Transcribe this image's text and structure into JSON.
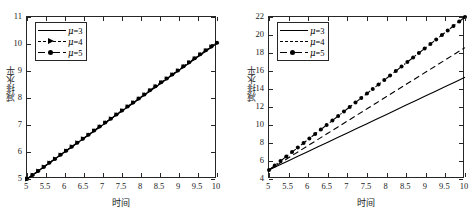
{
  "figure": {
    "panels": [
      {
        "id": "left",
        "axis_title_x": "时间",
        "axis_title_y": "减排水平",
        "xticks": [
          "5",
          "5.5",
          "6",
          "6.5",
          "7",
          "7.5",
          "8",
          "8.5",
          "9",
          "9.5",
          "10"
        ],
        "yticks": [
          "5",
          "6",
          "7",
          "8",
          "9",
          "10",
          "11"
        ],
        "legend": [
          {
            "label_prefix": "μ",
            "label_suffix": "=3",
            "style": "solid",
            "marker": "none"
          },
          {
            "label_prefix": "μ",
            "label_suffix": "=4",
            "style": "dashed",
            "marker": "triangle"
          },
          {
            "label_prefix": "μ",
            "label_suffix": "=5",
            "style": "dashdot",
            "marker": "circle"
          }
        ]
      },
      {
        "id": "right",
        "axis_title_x": "时间",
        "axis_title_y": "减排水平",
        "xticks": [
          "5",
          "5.5",
          "6",
          "6.5",
          "7",
          "7.5",
          "8",
          "8.5",
          "9",
          "9.5",
          "10"
        ],
        "yticks": [
          "4",
          "6",
          "8",
          "10",
          "12",
          "14",
          "16",
          "18",
          "20",
          "22"
        ],
        "legend": [
          {
            "label_prefix": "μ",
            "label_suffix": "=3",
            "style": "solid",
            "marker": "none"
          },
          {
            "label_prefix": "μ",
            "label_suffix": "=4",
            "style": "dashed",
            "marker": "none"
          },
          {
            "label_prefix": "μ",
            "label_suffix": "=5",
            "style": "dashdot",
            "marker": "circle"
          }
        ]
      }
    ]
  },
  "chart_data": [
    {
      "type": "line",
      "panel": "left",
      "title": "",
      "xlabel": "时间",
      "ylabel": "减排水平",
      "xlim": [
        5,
        10
      ],
      "ylim": [
        5,
        11
      ],
      "xticks": [
        5,
        5.5,
        6,
        6.5,
        7,
        7.5,
        8,
        8.5,
        9,
        9.5,
        10
      ],
      "yticks": [
        5,
        6,
        7,
        8,
        9,
        10,
        11
      ],
      "grid": false,
      "legend_position": "upper-left",
      "x": [
        5,
        5.25,
        5.5,
        5.75,
        6,
        6.25,
        6.5,
        6.75,
        7,
        7.25,
        7.5,
        7.75,
        8,
        8.25,
        8.5,
        8.75,
        9,
        9.25,
        9.5,
        9.75,
        10
      ],
      "series": [
        {
          "name": "μ=3",
          "style": "solid",
          "marker": "none",
          "values": [
            5.0,
            5.25,
            5.5,
            5.76,
            6.01,
            6.26,
            6.51,
            6.76,
            7.01,
            7.27,
            7.52,
            7.77,
            8.02,
            8.27,
            8.52,
            8.78,
            9.03,
            9.28,
            9.53,
            9.78,
            10.03
          ]
        },
        {
          "name": "μ=4",
          "style": "dashed",
          "marker": "triangle",
          "values": [
            5.0,
            5.25,
            5.51,
            5.76,
            6.01,
            6.27,
            6.52,
            6.77,
            7.02,
            7.28,
            7.53,
            7.78,
            8.03,
            8.29,
            8.54,
            8.79,
            9.04,
            9.29,
            9.55,
            9.8,
            10.04
          ]
        },
        {
          "name": "μ=5",
          "style": "dashdot",
          "marker": "circle",
          "values": [
            5.0,
            5.25,
            5.51,
            5.76,
            6.02,
            6.27,
            6.52,
            6.78,
            7.03,
            7.28,
            7.54,
            7.79,
            8.04,
            8.3,
            8.55,
            8.8,
            9.05,
            9.31,
            9.56,
            9.81,
            10.05
          ]
        }
      ]
    },
    {
      "type": "line",
      "panel": "right",
      "title": "",
      "xlabel": "时间",
      "ylabel": "减排水平",
      "xlim": [
        5,
        10
      ],
      "ylim": [
        4,
        22
      ],
      "xticks": [
        5,
        5.5,
        6,
        6.5,
        7,
        7.5,
        8,
        8.5,
        9,
        9.5,
        10
      ],
      "yticks": [
        4,
        6,
        8,
        10,
        12,
        14,
        16,
        18,
        20,
        22
      ],
      "grid": false,
      "legend_position": "upper-left",
      "x": [
        5,
        5.25,
        5.5,
        5.75,
        6,
        6.25,
        6.5,
        6.75,
        7,
        7.25,
        7.5,
        7.75,
        8,
        8.25,
        8.5,
        8.75,
        9,
        9.25,
        9.5,
        9.75,
        10
      ],
      "series": [
        {
          "name": "μ=3",
          "style": "solid",
          "marker": "none",
          "values": [
            5.0,
            5.52,
            6.03,
            6.55,
            7.06,
            7.58,
            8.09,
            8.61,
            9.12,
            9.64,
            10.15,
            10.67,
            11.18,
            11.7,
            12.21,
            12.73,
            13.24,
            13.76,
            14.27,
            14.79,
            15.3
          ]
        },
        {
          "name": "μ=4",
          "style": "dashed",
          "marker": "none",
          "values": [
            5.0,
            5.68,
            6.36,
            7.04,
            7.72,
            8.4,
            9.08,
            9.76,
            10.44,
            11.12,
            11.8,
            12.48,
            13.16,
            13.84,
            14.52,
            15.2,
            15.88,
            16.56,
            17.24,
            17.92,
            18.6
          ]
        },
        {
          "name": "μ=5",
          "style": "dashdot",
          "marker": "circle",
          "values": [
            5.0,
            5.85,
            6.7,
            7.55,
            8.4,
            9.25,
            10.1,
            10.95,
            11.8,
            12.65,
            13.5,
            14.35,
            15.2,
            16.05,
            16.9,
            17.75,
            18.6,
            19.45,
            20.3,
            21.15,
            22.0
          ]
        }
      ]
    }
  ]
}
